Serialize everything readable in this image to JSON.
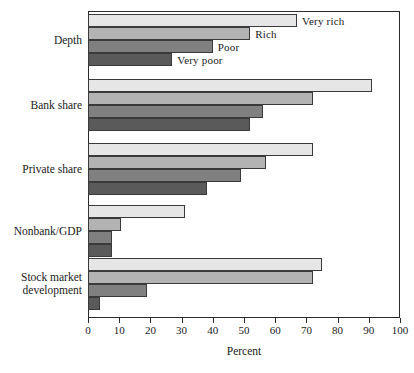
{
  "chart_data": {
    "type": "bar",
    "orientation": "horizontal",
    "grouped": true,
    "title": "",
    "xlabel": "Percent",
    "ylabel": "",
    "xlim": [
      0,
      100
    ],
    "xticks": [
      0,
      10,
      20,
      30,
      40,
      50,
      60,
      70,
      80,
      90,
      100
    ],
    "xtick_labels": [
      "0",
      "10",
      "20",
      "30",
      "40",
      "50",
      "60",
      "70",
      "80",
      "90",
      "100"
    ],
    "grid": false,
    "legend_position": "inline-right-of-first-group",
    "categories": [
      "Depth",
      "Bank share",
      "Private share",
      "Nonbank/GDP",
      "Stock market\ndevelopment"
    ],
    "series": [
      {
        "name": "Very rich",
        "color": "#e6e6e6",
        "values": [
          67,
          91,
          72,
          31,
          75
        ]
      },
      {
        "name": "Rich",
        "color": "#b3b3b3",
        "values": [
          52,
          72,
          57,
          10.5,
          72
        ]
      },
      {
        "name": "Poor",
        "color": "#808080",
        "values": [
          40,
          56,
          49,
          7.7,
          19
        ]
      },
      {
        "name": "Very poor",
        "color": "#5a5a5a",
        "values": [
          27,
          52,
          38,
          7.7,
          4
        ]
      }
    ],
    "inline_labels": [
      "Very rich",
      "Rich",
      "Poor",
      "Very poor"
    ]
  },
  "axis": {
    "x_title": "Percent"
  },
  "colors": {
    "frame": "#2b2b2b",
    "background": "#ffffff",
    "text": "#1a1a1a",
    "very_rich": "#e6e6e6",
    "rich": "#b3b3b3",
    "poor": "#808080",
    "very_poor": "#5a5a5a"
  }
}
